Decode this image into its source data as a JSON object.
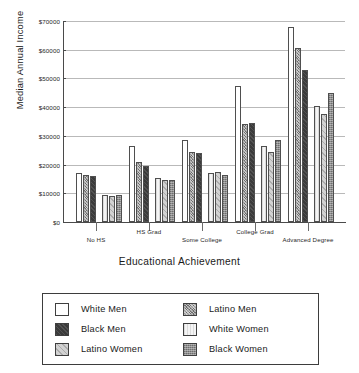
{
  "chart_data": {
    "type": "bar",
    "title": "",
    "xlabel": "Educational Achievement",
    "ylabel": "Median Annual Income",
    "categories": [
      "No HS",
      "HS Grad",
      "Some College",
      "College Grad",
      "Advanced Degree"
    ],
    "series": [
      {
        "name": "White Men",
        "swatch": "white-men",
        "values": [
          17000,
          26500,
          28500,
          47500,
          68000
        ]
      },
      {
        "name": "Latino Men",
        "swatch": "latino-men",
        "values": [
          16500,
          21000,
          24500,
          34000,
          60500
        ]
      },
      {
        "name": "Black Men",
        "swatch": "black-men",
        "values": [
          16000,
          19500,
          24000,
          34500,
          53000
        ]
      },
      {
        "name": "White Women",
        "swatch": "white-women",
        "values": [
          9500,
          15500,
          17000,
          26500,
          40500
        ]
      },
      {
        "name": "Latino Women",
        "swatch": "latino-women",
        "values": [
          9000,
          14500,
          17500,
          24500,
          37500
        ]
      },
      {
        "name": "Black Women",
        "swatch": "black-women",
        "values": [
          9500,
          14500,
          16500,
          28500,
          45000
        ]
      }
    ],
    "ylim": [
      0,
      70000
    ],
    "ytick_values": [
      0,
      10000,
      20000,
      30000,
      40000,
      50000,
      60000,
      70000
    ],
    "ytick_labels": [
      "$0",
      "$10000",
      "$20000",
      "$30000",
      "$40000",
      "$50000",
      "$60000",
      "$70000"
    ],
    "grid": true,
    "legend_position": "bottom",
    "legend_columns": 2,
    "legend_order": [
      "White Men",
      "Latino Men",
      "Black Men",
      "White Women",
      "Latino Women",
      "Black Women"
    ]
  }
}
